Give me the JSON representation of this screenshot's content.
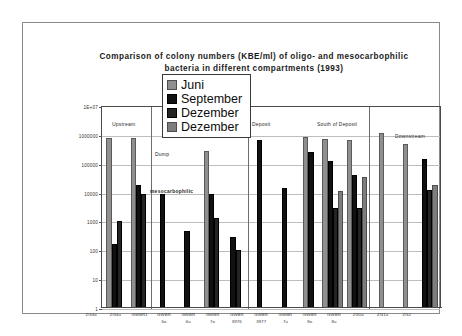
{
  "chart_data": {
    "type": "bar",
    "title": "Comparison of colony numbers  (KBE/ml) of oligo- and mesocarbophilic bacteria in different compartments (1993)",
    "title_line1": "Comparison of colony numbers  (KBE/ml) of oligo- and mesocarbophilic",
    "title_line2": "bacteria in different compartments (1993)",
    "xlabel": "",
    "ylabel": "",
    "yscale": "log",
    "ylim": [
      1,
      10000000
    ],
    "grid": true,
    "legend_position": "top-center",
    "ytick_labels": [
      "1E+07",
      "1000000",
      "100000",
      "10000",
      "1000",
      "100",
      "10",
      "1"
    ],
    "ytick_values": [
      10000000,
      1000000,
      100000,
      10000,
      1000,
      100,
      10,
      1
    ],
    "categories": [
      "ZG4o",
      "ZG4u",
      "GWBR1",
      "GWBR 6o",
      "GWBR 6u",
      "GWBR 7o",
      "GWBR 3976",
      "GWBR 3977",
      "GWBR 7u",
      "GWBR 8o",
      "GWBR 8u",
      "ZG1o",
      "ZG1u",
      "ZG2"
    ],
    "category_lines": [
      [
        "ZG4o",
        ""
      ],
      [
        "ZG4u",
        ""
      ],
      [
        "GWBR1",
        ""
      ],
      [
        "GWBR",
        "6o"
      ],
      [
        "GWBR",
        "6u"
      ],
      [
        "GWBR",
        "7o"
      ],
      [
        "GWBR",
        "3976"
      ],
      [
        "GWBR",
        "3977"
      ],
      [
        "GWBR",
        "7u"
      ],
      [
        "GWBR",
        "8o"
      ],
      [
        "GWBR",
        "8u"
      ],
      [
        "ZG1o",
        ""
      ],
      [
        "ZG1u",
        ""
      ],
      [
        "ZG2",
        ""
      ]
    ],
    "series": [
      {
        "name": "Juni",
        "color": "#8f8f8f",
        "values": [
          800000,
          750000,
          null,
          null,
          280000,
          null,
          null,
          null,
          850000,
          730000,
          680000,
          1200000,
          500000,
          null
        ]
      },
      {
        "name": "September",
        "color": "#111111",
        "values": [
          160,
          19000,
          9200,
          480,
          9000,
          300,
          680000,
          14000,
          250000,
          120000,
          42000,
          null,
          null,
          150000
        ]
      },
      {
        "name": "Dezember",
        "color": "#242424",
        "values": [
          1000,
          8800,
          null,
          null,
          1350,
          100,
          null,
          null,
          null,
          3000,
          3000,
          null,
          null,
          12000
        ]
      },
      {
        "name": "Dezember",
        "color": "#7d7d7d",
        "values": [
          null,
          null,
          null,
          null,
          null,
          null,
          null,
          null,
          null,
          11000,
          35000,
          null,
          null,
          19000
        ]
      }
    ],
    "compartments": [
      {
        "label": "Upstream"
      },
      {
        "label": "Deposit"
      },
      {
        "label": "South of Deposit"
      },
      {
        "label": "Downstream"
      }
    ],
    "annotations": [
      {
        "text": "Dump"
      },
      {
        "text": "mesocarbophilic"
      }
    ]
  },
  "legend": {
    "entries": [
      {
        "label": "Juni",
        "color": "#8f8f8f"
      },
      {
        "label": "September",
        "color": "#111111"
      },
      {
        "label": "Dezember",
        "color": "#242424"
      },
      {
        "label": "Dezember",
        "color": "#7d7d7d"
      }
    ]
  }
}
